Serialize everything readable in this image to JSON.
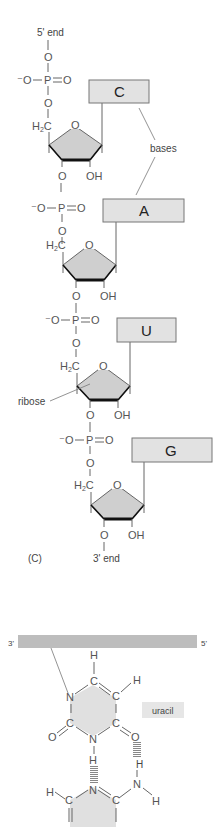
{
  "figure": {
    "panel_label": "(C)",
    "five_prime_label": "5' end",
    "three_prime_label": "3' end",
    "bases_label": "bases",
    "ribose_label": "ribose",
    "phosphate": {
      "neg_oxygen": "O",
      "phosphorus": "P",
      "double_oxygen": "O",
      "bridge_oxygen": "O"
    },
    "sugar": {
      "ch2": "H",
      "ch2_sub": "2",
      "ch2_c": "C",
      "ring_oxygen": "O",
      "hydroxyl": "OH",
      "o3": "O"
    },
    "nucleotides": [
      {
        "base": "C"
      },
      {
        "base": "A"
      },
      {
        "base": "U"
      },
      {
        "base": "G"
      }
    ]
  },
  "pairing": {
    "strand_left": "3'",
    "strand_right": "5'",
    "base_name": "uracil",
    "atoms": {
      "H": "H",
      "C": "C",
      "N": "N",
      "O": "O"
    }
  }
}
